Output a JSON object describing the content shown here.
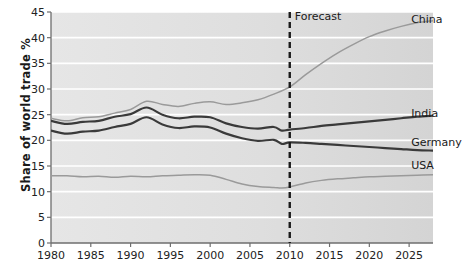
{
  "chart_data": {
    "type": "line",
    "title": "",
    "xlabel": "",
    "ylabel": "Share of world trade %",
    "xlim": [
      1980,
      2028
    ],
    "ylim": [
      0,
      45
    ],
    "grid": true,
    "legend_position": "right-inline",
    "xticks": [
      1980,
      1985,
      1990,
      1995,
      2000,
      2005,
      2010,
      2015,
      2020,
      2025
    ],
    "yticks": [
      0,
      5,
      10,
      15,
      20,
      25,
      30,
      35,
      40,
      45
    ],
    "annotations": [
      {
        "text": "Forecast",
        "x": 2010,
        "y": 44,
        "type": "vertical-dashed-line-label"
      }
    ],
    "forecast_start": 2010,
    "series": [
      {
        "name": "China",
        "color": "#9a9a9a",
        "label_x": 2025,
        "label_y": 43.4,
        "x": [
          1980,
          1982,
          1984,
          1986,
          1988,
          1990,
          1992,
          1994,
          1996,
          1998,
          2000,
          2002,
          2004,
          2006,
          2008,
          2010,
          2012,
          2014,
          2016,
          2018,
          2020,
          2022,
          2024,
          2026,
          2028
        ],
        "values": [
          24.3,
          23.8,
          24.4,
          24.6,
          25.3,
          26.0,
          27.6,
          27.0,
          26.6,
          27.2,
          27.5,
          27.0,
          27.3,
          27.9,
          29.0,
          30.4,
          32.8,
          35.0,
          37.0,
          38.7,
          40.2,
          41.3,
          42.2,
          42.9,
          43.3
        ]
      },
      {
        "name": "India",
        "color": "#3a3a3a",
        "label_x": 2025,
        "label_y": 25.2,
        "x": [
          1980,
          1982,
          1984,
          1986,
          1988,
          1990,
          1992,
          1994,
          1996,
          1998,
          2000,
          2002,
          2004,
          2006,
          2008,
          2009,
          2010,
          2012,
          2014,
          2016,
          2018,
          2020,
          2022,
          2024,
          2026,
          2028
        ],
        "values": [
          23.8,
          23.2,
          23.6,
          23.8,
          24.6,
          25.1,
          26.4,
          25.0,
          24.3,
          24.6,
          24.5,
          23.3,
          22.6,
          22.3,
          22.6,
          21.9,
          22.1,
          22.4,
          22.8,
          23.1,
          23.4,
          23.7,
          24.0,
          24.3,
          24.6,
          24.8
        ]
      },
      {
        "name": "Germany",
        "color": "#3a3a3a",
        "label_x": 2025,
        "label_y": 19.4,
        "x": [
          1980,
          1982,
          1984,
          1986,
          1988,
          1990,
          1992,
          1994,
          1996,
          1998,
          2000,
          2002,
          2004,
          2006,
          2008,
          2009,
          2010,
          2012,
          2014,
          2016,
          2018,
          2020,
          2022,
          2024,
          2026,
          2028
        ],
        "values": [
          21.9,
          21.3,
          21.7,
          21.9,
          22.6,
          23.2,
          24.5,
          23.1,
          22.4,
          22.7,
          22.5,
          21.3,
          20.4,
          19.9,
          20.1,
          19.3,
          19.6,
          19.5,
          19.3,
          19.1,
          18.9,
          18.7,
          18.5,
          18.3,
          18.1,
          18.0
        ]
      },
      {
        "name": "USA",
        "color": "#9a9a9a",
        "label_x": 2025,
        "label_y": 15.0,
        "x": [
          1980,
          1982,
          1984,
          1986,
          1988,
          1990,
          1992,
          1994,
          1996,
          1998,
          2000,
          2002,
          2004,
          2006,
          2008,
          2009,
          2010,
          2012,
          2014,
          2016,
          2018,
          2020,
          2022,
          2024,
          2026,
          2028
        ],
        "values": [
          13.1,
          13.1,
          12.9,
          13.0,
          12.8,
          13.0,
          12.9,
          13.1,
          13.2,
          13.3,
          13.2,
          12.4,
          11.5,
          11.0,
          10.8,
          10.7,
          10.9,
          11.7,
          12.2,
          12.5,
          12.7,
          12.9,
          13.0,
          13.1,
          13.2,
          13.3
        ]
      }
    ]
  }
}
